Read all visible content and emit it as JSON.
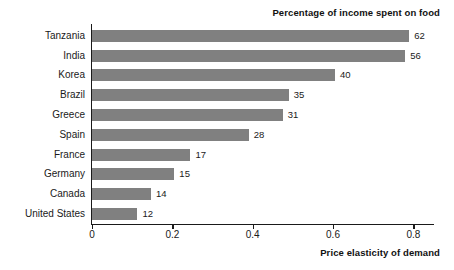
{
  "chart_data": {
    "type": "bar",
    "orientation": "horizontal",
    "title": "",
    "top_label": "Percentage of income spent on food",
    "xlabel": "Price elasticity of demand",
    "ylabel": "",
    "xlim": [
      0,
      0.8514
    ],
    "grid": false,
    "legend": "none",
    "xticks": [
      "0",
      "0.2",
      "0.4",
      "0.6",
      "0.8"
    ],
    "xtick_values": [
      0,
      0.2,
      0.4,
      0.6,
      0.8
    ],
    "bar_color": "#808080",
    "axis_color": "#1a1a1a",
    "categories": [
      "Tanzania",
      "India",
      "Korea",
      "Brazil",
      "Greece",
      "Spain",
      "France",
      "Germany",
      "Canada",
      "United States"
    ],
    "values": [
      0.79,
      0.78,
      0.605,
      0.49,
      0.475,
      0.39,
      0.245,
      0.205,
      0.147,
      0.113
    ],
    "data_labels": [
      "62",
      "56",
      "40",
      "35",
      "31",
      "28",
      "17",
      "15",
      "14",
      "12"
    ],
    "rows": [
      {
        "category": "Tanzania",
        "value": 0.79,
        "label": "62"
      },
      {
        "category": "India",
        "value": 0.78,
        "label": "56"
      },
      {
        "category": "Korea",
        "value": 0.605,
        "label": "40"
      },
      {
        "category": "Brazil",
        "value": 0.49,
        "label": "35"
      },
      {
        "category": "Greece",
        "value": 0.475,
        "label": "31"
      },
      {
        "category": "Spain",
        "value": 0.39,
        "label": "28"
      },
      {
        "category": "France",
        "value": 0.245,
        "label": "17"
      },
      {
        "category": "Germany",
        "value": 0.205,
        "label": "15"
      },
      {
        "category": "Canada",
        "value": 0.147,
        "label": "14"
      },
      {
        "category": "United States",
        "value": 0.113,
        "label": "12"
      }
    ]
  }
}
